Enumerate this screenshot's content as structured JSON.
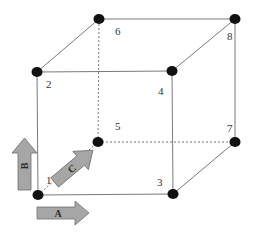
{
  "diagram": {
    "type": "cube-vertex-numbering",
    "colors": {
      "edge": "#7a7a7a",
      "vertex": "#111111",
      "arrow_fill": "#a6a6a6",
      "arrow_stroke": "#6e6e6e",
      "label": "#333333"
    },
    "vertices": [
      {
        "id": "1",
        "label": "1",
        "x": 38,
        "y": 195
      },
      {
        "id": "2",
        "label": "2",
        "x": 37,
        "y": 72
      },
      {
        "id": "3",
        "label": "3",
        "x": 173,
        "y": 194
      },
      {
        "id": "4",
        "label": "4",
        "x": 172,
        "y": 71
      },
      {
        "id": "5",
        "label": "5",
        "x": 98,
        "y": 142
      },
      {
        "id": "6",
        "label": "6",
        "x": 99,
        "y": 19
      },
      {
        "id": "7",
        "label": "7",
        "x": 235,
        "y": 142
      },
      {
        "id": "8",
        "label": "8",
        "x": 235,
        "y": 19
      }
    ],
    "edges_visible": [
      [
        "1",
        "2"
      ],
      [
        "1",
        "3"
      ],
      [
        "2",
        "4"
      ],
      [
        "3",
        "4"
      ],
      [
        "2",
        "6"
      ],
      [
        "4",
        "8"
      ],
      [
        "6",
        "8"
      ],
      [
        "3",
        "7"
      ],
      [
        "7",
        "8"
      ]
    ],
    "edges_hidden": [
      [
        "1",
        "5"
      ],
      [
        "5",
        "6"
      ],
      [
        "5",
        "7"
      ]
    ],
    "arrows": [
      {
        "id": "A",
        "label": "A",
        "direction": "right"
      },
      {
        "id": "B",
        "label": "B",
        "direction": "up"
      },
      {
        "id": "C",
        "label": "C",
        "direction": "diagonal-back"
      }
    ]
  }
}
